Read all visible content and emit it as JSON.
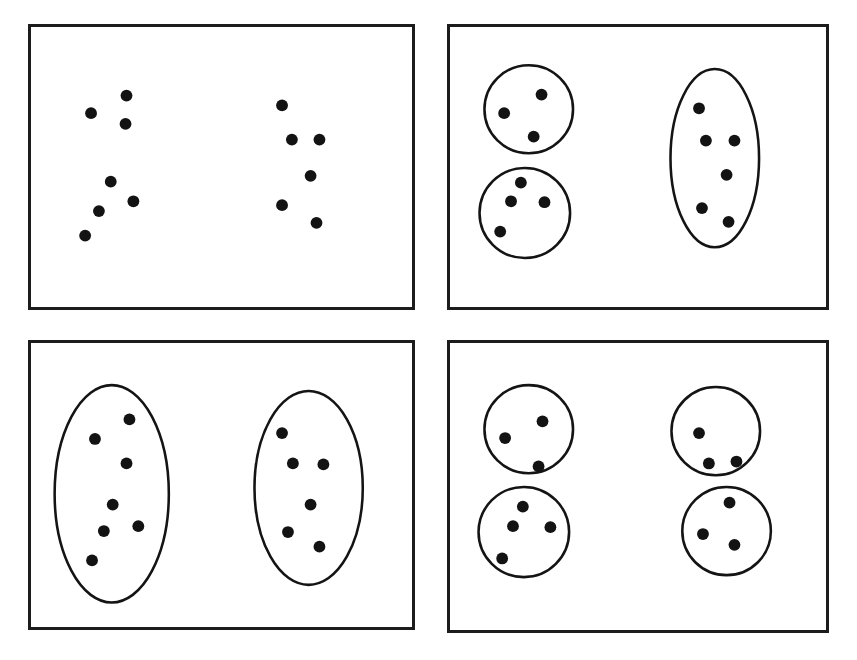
{
  "figure": {
    "caption": "",
    "background_color": "#ffffff",
    "ink_color": "#131313",
    "border_color": "#1c1c1c",
    "width": 857,
    "height": 660
  },
  "chart_data": {
    "type": "scatter",
    "title": "",
    "xlabel": "",
    "ylabel": "",
    "grid": false,
    "legend": "none",
    "panels": [
      {
        "id": "panel-top-left",
        "label": "",
        "position": "top-left",
        "box": {
          "x": 28,
          "y": 24,
          "w": 387,
          "h": 286
        },
        "shape_count": 0,
        "dot_count": 13,
        "shapes": [],
        "points": [
          {
            "x": 125,
            "y": 94
          },
          {
            "x": 89,
            "y": 112
          },
          {
            "x": 124,
            "y": 123
          },
          {
            "x": 109,
            "y": 182
          },
          {
            "x": 132,
            "y": 202
          },
          {
            "x": 97,
            "y": 212
          },
          {
            "x": 83,
            "y": 237
          },
          {
            "x": 283,
            "y": 104
          },
          {
            "x": 293,
            "y": 139
          },
          {
            "x": 321,
            "y": 139
          },
          {
            "x": 312,
            "y": 176
          },
          {
            "x": 283,
            "y": 206
          },
          {
            "x": 318,
            "y": 224
          }
        ]
      },
      {
        "id": "panel-top-right",
        "label": "",
        "position": "top-right",
        "box": {
          "x": 447,
          "y": 24,
          "w": 382,
          "h": 286
        },
        "shape_count": 3,
        "dot_count": 13,
        "shapes": [
          {
            "kind": "circle",
            "cx": 527,
            "cy": 108,
            "rx": 45,
            "ry": 45
          },
          {
            "kind": "circle",
            "cx": 523,
            "cy": 214,
            "rx": 46,
            "ry": 46
          },
          {
            "kind": "ellipse",
            "cx": 716,
            "cy": 158,
            "rx": 45,
            "ry": 91
          }
        ],
        "points": [
          {
            "x": 540,
            "y": 93
          },
          {
            "x": 502,
            "y": 112
          },
          {
            "x": 532,
            "y": 136
          },
          {
            "x": 519,
            "y": 183
          },
          {
            "x": 543,
            "y": 203
          },
          {
            "x": 509,
            "y": 202
          },
          {
            "x": 498,
            "y": 233
          },
          {
            "x": 700,
            "y": 107
          },
          {
            "x": 707,
            "y": 140
          },
          {
            "x": 736,
            "y": 140
          },
          {
            "x": 728,
            "y": 175
          },
          {
            "x": 703,
            "y": 209
          },
          {
            "x": 730,
            "y": 223
          }
        ]
      },
      {
        "id": "panel-bottom-left",
        "label": "",
        "position": "bottom-left",
        "box": {
          "x": 28,
          "y": 340,
          "w": 387,
          "h": 290
        },
        "shape_count": 2,
        "dot_count": 13,
        "shapes": [
          {
            "kind": "ellipse",
            "cx": 110,
            "cy": 494,
            "rx": 58,
            "ry": 111
          },
          {
            "kind": "ellipse",
            "cx": 310,
            "cy": 488,
            "rx": 55,
            "ry": 99
          }
        ],
        "points": [
          {
            "x": 128,
            "y": 418
          },
          {
            "x": 93,
            "y": 438
          },
          {
            "x": 125,
            "y": 463
          },
          {
            "x": 111,
            "y": 505
          },
          {
            "x": 137,
            "y": 527
          },
          {
            "x": 102,
            "y": 532
          },
          {
            "x": 90,
            "y": 562
          },
          {
            "x": 283,
            "y": 432
          },
          {
            "x": 294,
            "y": 463
          },
          {
            "x": 325,
            "y": 464
          },
          {
            "x": 312,
            "y": 505
          },
          {
            "x": 289,
            "y": 533
          },
          {
            "x": 321,
            "y": 548
          }
        ]
      },
      {
        "id": "panel-bottom-right",
        "label": "",
        "position": "bottom-right",
        "box": {
          "x": 447,
          "y": 340,
          "w": 382,
          "h": 293
        },
        "shape_count": 4,
        "dot_count": 13,
        "shapes": [
          {
            "kind": "circle",
            "cx": 527,
            "cy": 428,
            "rx": 45,
            "ry": 45
          },
          {
            "kind": "circle",
            "cx": 522,
            "cy": 533,
            "rx": 46,
            "ry": 46
          },
          {
            "kind": "circle",
            "cx": 717,
            "cy": 430,
            "rx": 45,
            "ry": 45
          },
          {
            "kind": "circle",
            "cx": 728,
            "cy": 532,
            "rx": 45,
            "ry": 45
          }
        ],
        "points": [
          {
            "x": 541,
            "y": 420
          },
          {
            "x": 503,
            "y": 437
          },
          {
            "x": 537,
            "y": 466
          },
          {
            "x": 521,
            "y": 507
          },
          {
            "x": 511,
            "y": 527
          },
          {
            "x": 549,
            "y": 528
          },
          {
            "x": 500,
            "y": 560
          },
          {
            "x": 700,
            "y": 432
          },
          {
            "x": 710,
            "y": 463
          },
          {
            "x": 738,
            "y": 461
          },
          {
            "x": 731,
            "y": 503
          },
          {
            "x": 704,
            "y": 535
          },
          {
            "x": 736,
            "y": 546
          }
        ]
      }
    ],
    "dot_radius": 6
  }
}
